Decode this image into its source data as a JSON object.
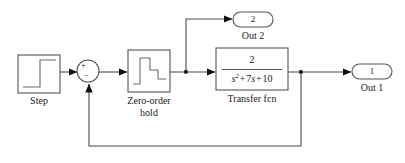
{
  "diagram": {
    "type": "simulink-block-diagram",
    "background_color": "#ffffff",
    "line_color": "#4a4a4a",
    "block_stroke_color": "#555555",
    "text_color": "#1a1a1a"
  },
  "blocks": {
    "step": {
      "label": "Step",
      "icon": "step-waveform-icon",
      "x": 18,
      "y": 55,
      "w": 42,
      "h": 38
    },
    "sum": {
      "label": "",
      "icon": "sum-junction-icon",
      "plus_sign": "+",
      "minus_sign": "−",
      "cx": 88,
      "cy": 71,
      "r": 11
    },
    "zero_order_hold": {
      "label": "Zero-order\nhold",
      "label_line1": "Zero-order",
      "label_line2": "hold",
      "icon": "staircase-hold-icon",
      "x": 128,
      "y": 50,
      "w": 42,
      "h": 42
    },
    "transfer_fcn": {
      "label": "Transfer fcn",
      "numerator": "2",
      "denominator_plain": "s^2+7s+10",
      "x": 216,
      "y": 48,
      "w": 72,
      "h": 42
    }
  },
  "ports": {
    "out2": {
      "number": "2",
      "label": "Out 2",
      "x": 233,
      "y": 12,
      "w": 40,
      "h": 16
    },
    "out1": {
      "number": "1",
      "label": "Out 1",
      "x": 352,
      "y": 64,
      "w": 40,
      "h": 16
    }
  },
  "signals": [
    {
      "name": "step-to-sum",
      "from": "step",
      "to": "sum"
    },
    {
      "name": "sum-to-zoh",
      "from": "sum",
      "to": "zero_order_hold"
    },
    {
      "name": "zoh-to-transfer",
      "from": "zero_order_hold",
      "to": "transfer_fcn"
    },
    {
      "name": "zoh-branch-to-out2",
      "from": "zero_order_hold",
      "to": "out2"
    },
    {
      "name": "transfer-to-out1",
      "from": "transfer_fcn",
      "to": "out1"
    },
    {
      "name": "feedback-to-sum",
      "from": "transfer_fcn",
      "to": "sum"
    }
  ],
  "junctions": [
    {
      "name": "zoh-output-junction",
      "x": 186,
      "y": 72
    },
    {
      "name": "transfer-output-junction",
      "x": 301,
      "y": 72
    }
  ]
}
